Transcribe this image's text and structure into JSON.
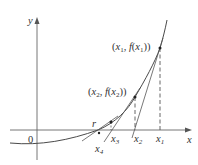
{
  "diagram": {
    "axes": {
      "x_label": "x",
      "y_label": "y",
      "origin_label": "0"
    },
    "points": [
      {
        "label": "(x1, f(x1))",
        "text_parts": [
          "(",
          "x",
          "1",
          ", ",
          "f",
          "(",
          "x",
          "1",
          "))"
        ]
      },
      {
        "label": "(x2, f(x2))",
        "text_parts": [
          "(",
          "x",
          "2",
          ", ",
          "f",
          "(",
          "x",
          "2",
          "))"
        ]
      }
    ],
    "x_ticks": [
      {
        "label": "x",
        "sub": "1"
      },
      {
        "label": "x",
        "sub": "2"
      },
      {
        "label": "x",
        "sub": "3"
      },
      {
        "label": "x",
        "sub": "4"
      }
    ],
    "root_label": "r",
    "colors": {
      "curve": "#4a4a4a",
      "axis": "#666666",
      "tangent": "#555555",
      "dashed": "#555555",
      "text": "#333333"
    }
  }
}
